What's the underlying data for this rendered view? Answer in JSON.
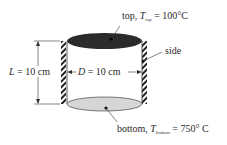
{
  "diagram": {
    "type": "cylinder-heat-transfer",
    "labels": {
      "top": {
        "prefix": "top, ",
        "symbol": "T",
        "subscript": "top",
        "value": " = 100°C"
      },
      "bottom": {
        "prefix": "bottom, ",
        "symbol": "T",
        "subscript": "bottom",
        "value": " = 750° C"
      },
      "side": "side",
      "length": {
        "symbol": "L",
        "value": " = 10 cm"
      },
      "diameter": {
        "symbol": "D",
        "value": " = 10 cm"
      }
    },
    "colors": {
      "top_fill": "#2b2b2b",
      "bottom_fill": "#d6d6d6",
      "line": "#333333"
    }
  }
}
